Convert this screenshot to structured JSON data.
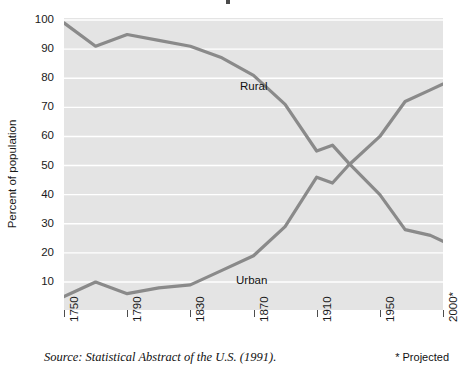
{
  "chart_data": {
    "type": "line",
    "title": "",
    "xlabel": "",
    "ylabel": "Percent of population",
    "ylim": [
      0,
      100
    ],
    "yticks": [
      10,
      20,
      30,
      40,
      50,
      60,
      70,
      80,
      90,
      100
    ],
    "grid": true,
    "legend": "inline-labels",
    "x": [
      "1750",
      "1770",
      "1790",
      "1810",
      "1830",
      "1850",
      "1870",
      "1890",
      "1910",
      "1920",
      "1930",
      "1950",
      "1970",
      "1990",
      "2000*"
    ],
    "xtick_labels": [
      "1750",
      "1790",
      "1830",
      "1870",
      "1910",
      "1950",
      "2000*"
    ],
    "series": [
      {
        "name": "Rural",
        "color": "#8a8a8a",
        "values": [
          99,
          91,
          95,
          93,
          91,
          87,
          81,
          71,
          55,
          57,
          51,
          40,
          28,
          26,
          24
        ]
      },
      {
        "name": "Urban",
        "color": "#8a8a8a",
        "values": [
          5,
          10,
          6,
          8,
          9,
          14,
          19,
          29,
          46,
          44,
          50,
          60,
          72,
          76,
          78
        ]
      }
    ],
    "annotations": {
      "rural_label": "Rural",
      "urban_label": "Urban"
    }
  },
  "footer": {
    "source": "Source: Statistical Abstract of the U.S. (1991).",
    "projected_note": "* Projected"
  },
  "colors": {
    "plot_background": "#e4e4e4",
    "gridline": "#ffffff",
    "line": "#8a8a8a",
    "text": "#1a1a1a",
    "page_background": "#ffffff"
  }
}
